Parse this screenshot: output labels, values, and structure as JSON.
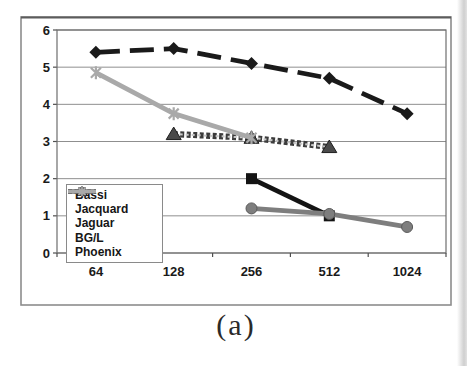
{
  "caption": {
    "text": "(a)"
  },
  "chart_data": {
    "type": "line",
    "title": "",
    "xlabel": "Processors",
    "ylabel": "Gflops/Processor",
    "categories": [
      "64",
      "128",
      "256",
      "512",
      "1024"
    ],
    "ylim": [
      0,
      6
    ],
    "yticks": [
      0,
      1,
      2,
      3,
      4,
      5,
      6
    ],
    "grid": true,
    "legend_position": "inside-lower-left",
    "series": [
      {
        "name": "Bassi",
        "marker": "diamond",
        "line_style": "dashed",
        "color": "#1a1a1a",
        "values": [
          5.4,
          5.5,
          5.1,
          4.7,
          3.75
        ]
      },
      {
        "name": "Jacquard",
        "marker": "square",
        "line_style": "solid",
        "color": "#141414",
        "values": [
          null,
          null,
          2.0,
          1.0,
          null
        ]
      },
      {
        "name": "Jaguar",
        "marker": "triangle",
        "line_style": "textured",
        "color": "#3c3c3c",
        "values": [
          null,
          3.2,
          3.1,
          2.85,
          null
        ]
      },
      {
        "name": "BG/L",
        "marker": "circle",
        "line_style": "solid",
        "color": "#7e7e7e",
        "values": [
          null,
          null,
          1.2,
          1.05,
          0.7
        ]
      },
      {
        "name": "Phoenix",
        "marker": "star",
        "line_style": "solid",
        "color": "#a9a9a9",
        "values": [
          4.85,
          3.75,
          3.1,
          null,
          null
        ]
      }
    ]
  }
}
